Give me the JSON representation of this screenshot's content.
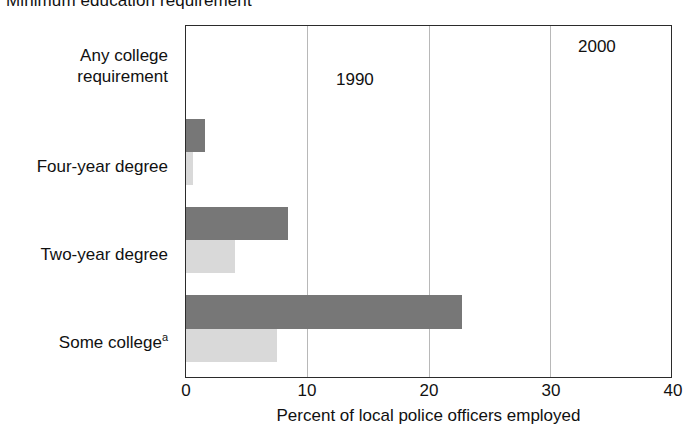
{
  "chart_data": {
    "type": "bar",
    "orientation": "horizontal",
    "title": "Minimum education requirement",
    "xlabel": "Percent of local police officers employed",
    "ylabel": "",
    "xlim": [
      0,
      40
    ],
    "xticks": [
      "0",
      "10",
      "20",
      "30",
      "40"
    ],
    "grid": true,
    "legend_position": "inline-annotation",
    "categories": [
      "Any college requirement",
      "Four-year degree",
      "Two-year degree",
      "Some college"
    ],
    "category_labels": [
      {
        "line1": "Any college",
        "line2": "requirement",
        "footnote": ""
      },
      {
        "line1": "Four-year degree",
        "line2": "",
        "footnote": ""
      },
      {
        "line1": "Two-year degree",
        "line2": "",
        "footnote": ""
      },
      {
        "line1": "Some college",
        "line2": "",
        "footnote": "a"
      }
    ],
    "series": [
      {
        "name": "2000",
        "color": "#777777",
        "values": [
          31.0,
          1.6,
          8.4,
          22.8
        ]
      },
      {
        "name": "1990",
        "color": "#d9d9d9",
        "values": [
          10.6,
          0.6,
          4.0,
          7.5
        ]
      }
    ],
    "annotations": [
      {
        "text": "2000",
        "series": "2000",
        "category": "Any college requirement"
      },
      {
        "text": "1990",
        "series": "1990",
        "category": "Any college requirement"
      }
    ],
    "footnotes": [
      {
        "marker": "a",
        "text": ""
      }
    ]
  }
}
